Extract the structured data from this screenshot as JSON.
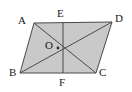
{
  "figure": {
    "type": "geometry-diagram",
    "background_color": "#ffffff",
    "fill_color": "#c9c9c9",
    "stroke_color": "#4a4a4a",
    "label_color": "#1a1a1a",
    "stroke_width": 1,
    "shape": {
      "name": "parallelogram",
      "vertex_order": [
        "A",
        "D",
        "C",
        "B"
      ],
      "polygon_points": "34,23 112,22 96,73 20,73"
    },
    "points": [
      {
        "id": "A",
        "label": "A",
        "x": 34,
        "y": 23,
        "label_x": 18,
        "label_y": 15,
        "role": "vertex"
      },
      {
        "id": "D",
        "label": "D",
        "x": 112,
        "y": 22,
        "label_x": 115,
        "label_y": 13,
        "role": "vertex"
      },
      {
        "id": "B",
        "label": "B",
        "x": 20,
        "y": 73,
        "label_x": 9,
        "label_y": 67,
        "role": "vertex"
      },
      {
        "id": "C",
        "label": "C",
        "x": 96,
        "y": 73,
        "label_x": 99,
        "label_y": 67,
        "role": "vertex"
      },
      {
        "id": "E",
        "label": "E",
        "x": 63,
        "y": 22,
        "label_x": 57,
        "label_y": 8,
        "role": "midpoint-on-AD"
      },
      {
        "id": "F",
        "label": "F",
        "x": 63,
        "y": 73,
        "label_x": 59,
        "label_y": 77,
        "role": "midpoint-on-BC"
      },
      {
        "id": "O",
        "label": "O",
        "x": 58,
        "y": 48,
        "label_x": 45,
        "label_y": 40,
        "role": "diagonal-intersection"
      }
    ],
    "segments": [
      {
        "id": "side-AD",
        "from": "A",
        "to": "D",
        "kind": "side"
      },
      {
        "id": "side-DC",
        "from": "D",
        "to": "C",
        "kind": "side"
      },
      {
        "id": "side-CB",
        "from": "C",
        "to": "B",
        "kind": "side"
      },
      {
        "id": "side-BA",
        "from": "B",
        "to": "A",
        "kind": "side"
      },
      {
        "id": "diagonal-AC",
        "from": "A",
        "to": "C",
        "kind": "diagonal"
      },
      {
        "id": "diagonal-BD",
        "from": "B",
        "to": "D",
        "kind": "diagonal"
      },
      {
        "id": "segment-EF",
        "from": "E",
        "to": "F",
        "kind": "cevian"
      }
    ]
  }
}
